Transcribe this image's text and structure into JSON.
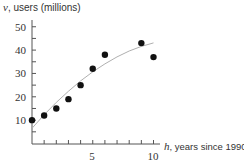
{
  "chart_data": {
    "type": "scatter",
    "title": "",
    "ylabel_var": "v",
    "ylabel_text": ", users (millions)",
    "xlabel_var": "h",
    "xlabel_text": ", years since 1990",
    "xlim": [
      0,
      10.5
    ],
    "ylim": [
      0,
      53
    ],
    "x_ticks_major": [
      5,
      10
    ],
    "x_ticks_minor": [
      1,
      2,
      3,
      4,
      6,
      7,
      8,
      9,
      10
    ],
    "y_ticks_major": [
      10,
      20,
      30,
      40,
      50
    ],
    "y_ticks_minor": [
      5,
      15,
      25,
      35,
      45
    ],
    "grid": false,
    "legend": null,
    "series": [
      {
        "name": "data points",
        "type": "scatter",
        "x": [
          0,
          1,
          2,
          3,
          4,
          5,
          6,
          9,
          10
        ],
        "y": [
          10,
          12,
          15,
          19,
          25,
          32,
          38,
          43,
          37
        ],
        "color": "#111111"
      },
      {
        "name": "fitted curve",
        "type": "line",
        "x": [
          0,
          1,
          2,
          3,
          4,
          5,
          6,
          7,
          8,
          9,
          10
        ],
        "y": [
          6.5,
          12.3,
          17.6,
          22.4,
          26.8,
          30.7,
          34.1,
          37.1,
          39.6,
          41.6,
          43.1
        ],
        "color": "#b0b0b0"
      }
    ]
  },
  "labels": {
    "y_title_var": "v",
    "y_title_text": ", users (millions)",
    "x_title_var": "h",
    "x_title_text": ", years since 1990",
    "y_tick_10": "10",
    "y_tick_20": "20",
    "y_tick_30": "30",
    "y_tick_40": "40",
    "y_tick_50": "50",
    "x_tick_5": "5",
    "x_tick_10": "10"
  }
}
